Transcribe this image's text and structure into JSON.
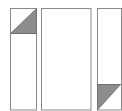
{
  "diagram": {
    "colors": {
      "background": "#ffffff",
      "stroke": "#8a8a8a",
      "fill": "#8c8c8c"
    },
    "panels": [
      {
        "id": "left",
        "x": 10,
        "y": 8,
        "w": 26,
        "h": 102,
        "triangle": {
          "position": "top",
          "points": "36,8 36,33 10,33"
        },
        "divider_y": 33
      },
      {
        "id": "middle",
        "x": 41,
        "y": 8,
        "w": 50,
        "h": 102
      },
      {
        "id": "right",
        "x": 97,
        "y": 8,
        "w": 25,
        "h": 102,
        "triangle": {
          "position": "bottom",
          "points": "97,84 120,84 97,110"
        },
        "divider_y": 84
      }
    ]
  }
}
